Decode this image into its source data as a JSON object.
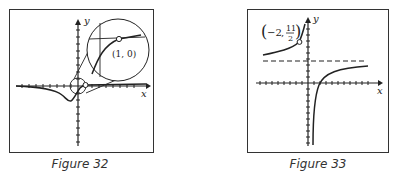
{
  "figures": [
    {
      "id": "figure-32",
      "caption": "Figure 32",
      "axis_labels": {
        "x": "x",
        "y": "y"
      },
      "annotation": "(1, 0)",
      "description": "Graph with a dip near origin crossing x-axis, with magnified inset circle showing the point (1, 0) as an open circle"
    },
    {
      "id": "figure-33",
      "caption": "Figure 33",
      "axis_labels": {
        "x": "x",
        "y": "y"
      },
      "annotation_point": {
        "x": "−2",
        "y_num": "11",
        "y_den": "2"
      },
      "description": "Graph with horizontal dashed asymptote, vertical asymptote near x=0, open circle at (−2, 11/2)"
    }
  ]
}
